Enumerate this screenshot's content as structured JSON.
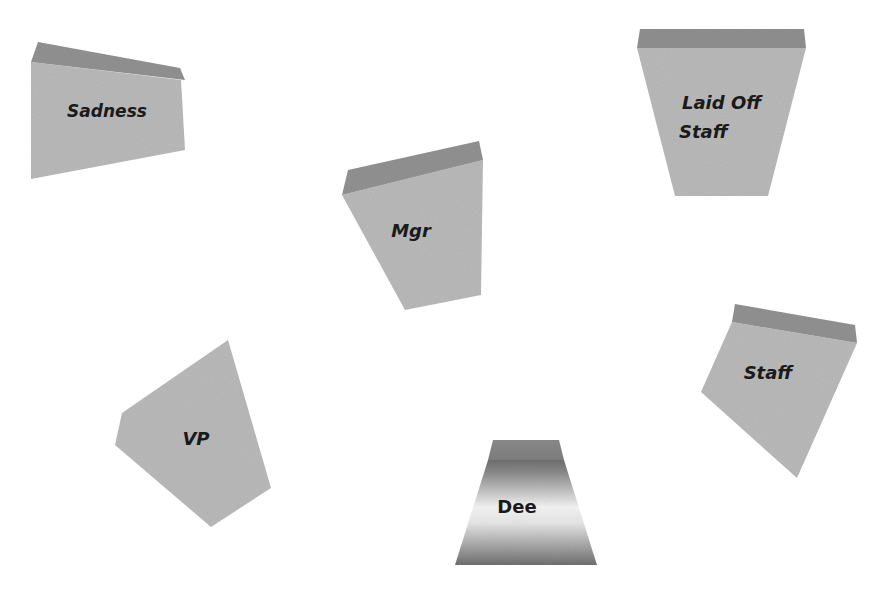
{
  "diagram": {
    "colors": {
      "background": "#ffffff",
      "face": "#b8b8b8",
      "top": "#8f8f8f",
      "text": "#1a1a1a",
      "dee_dark": "#7a7a7a",
      "dee_light": "#f2f2f2"
    },
    "blocks": [
      {
        "id": "sadness",
        "label": "Sadness",
        "italic": true
      },
      {
        "id": "laid-off-staff",
        "label_line1": "Laid Off",
        "label_line2": "Staff",
        "italic": true
      },
      {
        "id": "mgr",
        "label": "Mgr",
        "italic": true
      },
      {
        "id": "vp",
        "label": "VP",
        "italic": true
      },
      {
        "id": "staff",
        "label": "Staff",
        "italic": true
      },
      {
        "id": "dee",
        "label": "Dee",
        "italic": false
      }
    ]
  }
}
